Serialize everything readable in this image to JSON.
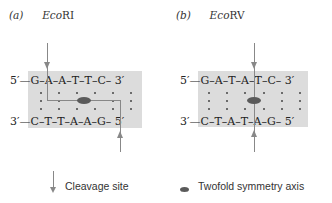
{
  "panels": [
    {
      "letter": "(a)",
      "enzyme_italic": "Eco",
      "enzyme_roman": "RI",
      "top_strand": {
        "left_end": "5′",
        "bases": [
          "G",
          "A",
          "A",
          "T",
          "T",
          "C"
        ],
        "right_end": "3′"
      },
      "bottom_strand": {
        "left_end": "3′",
        "bases": [
          "C",
          "T",
          "T",
          "A",
          "A",
          "G"
        ],
        "right_end": "5′"
      },
      "cleavage": "staggered"
    },
    {
      "letter": "(b)",
      "enzyme_italic": "Eco",
      "enzyme_roman": "RV",
      "top_strand": {
        "left_end": "5′",
        "bases": [
          "G",
          "A",
          "T",
          "A",
          "T",
          "C"
        ],
        "right_end": "3′"
      },
      "bottom_strand": {
        "left_end": "3′",
        "bases": [
          "C",
          "T",
          "A",
          "T",
          "A",
          "G"
        ],
        "right_end": "5′"
      },
      "cleavage": "blunt"
    }
  ],
  "legend": {
    "cleavage_label": "Cleavage site",
    "symmetry_label": "Twofold symmetry axis"
  },
  "colors": {
    "box_fill": "#dcdcdc",
    "line": "#888888",
    "ellipse": "#5a5a5a"
  }
}
